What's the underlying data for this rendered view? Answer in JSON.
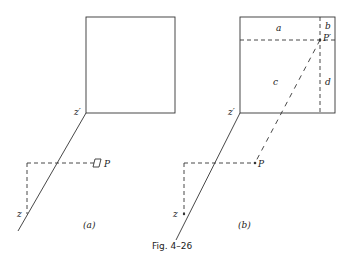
{
  "figure": {
    "caption": "Fig. 4–26",
    "panels": [
      {
        "id": "a",
        "label": "(a)",
        "points": {
          "z_prime": "z′",
          "z": "z",
          "p": "P"
        }
      },
      {
        "id": "b",
        "label": "(b)",
        "points": {
          "z_prime": "z′",
          "z": "z",
          "p": "P",
          "p_prime": "P′"
        },
        "regions": {
          "a": "a",
          "b": "b",
          "c": "c",
          "d": "d"
        }
      }
    ]
  },
  "colors": {
    "stroke": "#333333",
    "background": "#ffffff"
  }
}
